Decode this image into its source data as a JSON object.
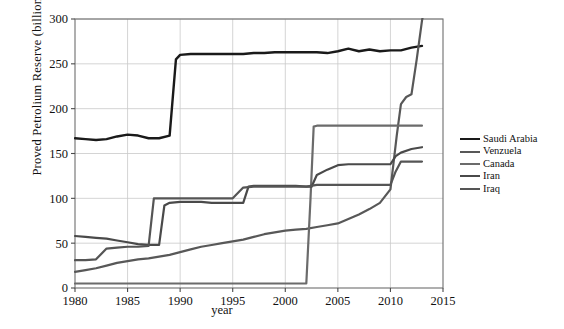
{
  "chart_data": {
    "type": "line",
    "title": "",
    "xlabel": "year",
    "ylabel": "Proved Petrolium Reserve (billions of Barrels)",
    "xlim": [
      1980,
      2015
    ],
    "ylim": [
      0,
      300
    ],
    "xticks": [
      1980,
      1985,
      1990,
      1995,
      2000,
      2005,
      2010,
      2015
    ],
    "yticks": [
      0,
      50,
      100,
      150,
      200,
      250,
      300
    ],
    "grid": true,
    "legend_position": "right",
    "series": [
      {
        "name": "Saudi Arabia",
        "color": "#1a1a1a",
        "width": 2.4,
        "points": [
          [
            1980,
            167
          ],
          [
            1981,
            166
          ],
          [
            1982,
            165
          ],
          [
            1983,
            166
          ],
          [
            1984,
            169
          ],
          [
            1985,
            171
          ],
          [
            1986,
            170
          ],
          [
            1987,
            167
          ],
          [
            1988,
            167
          ],
          [
            1989,
            170
          ],
          [
            1989.6,
            255
          ],
          [
            1990,
            260
          ],
          [
            1991,
            261
          ],
          [
            1992,
            261
          ],
          [
            1993,
            261
          ],
          [
            1994,
            261
          ],
          [
            1995,
            261
          ],
          [
            1996,
            261
          ],
          [
            1997,
            262
          ],
          [
            1998,
            262
          ],
          [
            1999,
            263
          ],
          [
            2000,
            263
          ],
          [
            2001,
            263
          ],
          [
            2002,
            263
          ],
          [
            2003,
            263
          ],
          [
            2004,
            262
          ],
          [
            2005,
            264
          ],
          [
            2006,
            267
          ],
          [
            2007,
            264
          ],
          [
            2008,
            266
          ],
          [
            2009,
            264
          ],
          [
            2010,
            265
          ],
          [
            2011,
            265
          ],
          [
            2012,
            268
          ],
          [
            2013,
            270
          ]
        ]
      },
      {
        "name": "Venzuela",
        "color": "#585858",
        "width": 2.2,
        "points": [
          [
            1980,
            18
          ],
          [
            1981,
            20
          ],
          [
            1982,
            22
          ],
          [
            1983,
            25
          ],
          [
            1984,
            28
          ],
          [
            1985,
            30
          ],
          [
            1986,
            32
          ],
          [
            1987,
            33
          ],
          [
            1988,
            35
          ],
          [
            1989,
            37
          ],
          [
            1990,
            40
          ],
          [
            1991,
            43
          ],
          [
            1992,
            46
          ],
          [
            1993,
            48
          ],
          [
            1994,
            50
          ],
          [
            1995,
            52
          ],
          [
            1996,
            54
          ],
          [
            1997,
            57
          ],
          [
            1998,
            60
          ],
          [
            1999,
            62
          ],
          [
            2000,
            64
          ],
          [
            2001,
            65
          ],
          [
            2002,
            66
          ],
          [
            2003,
            68
          ],
          [
            2004,
            70
          ],
          [
            2005,
            72
          ],
          [
            2006,
            77
          ],
          [
            2007,
            82
          ],
          [
            2008,
            88
          ],
          [
            2009,
            95
          ],
          [
            2010,
            110
          ],
          [
            2010.6,
            170
          ],
          [
            2011,
            205
          ],
          [
            2011.5,
            213
          ],
          [
            2012,
            216
          ],
          [
            2012.5,
            255
          ],
          [
            2013,
            298
          ],
          [
            2013.2,
            310
          ]
        ]
      },
      {
        "name": "Canada",
        "color": "#6b6b6b",
        "width": 2.2,
        "points": [
          [
            1980,
            5
          ],
          [
            1985,
            5
          ],
          [
            1990,
            5
          ],
          [
            1995,
            5
          ],
          [
            2000,
            5
          ],
          [
            2002,
            5
          ],
          [
            2002.4,
            100
          ],
          [
            2002.7,
            180
          ],
          [
            2003,
            181
          ],
          [
            2004,
            181
          ],
          [
            2005,
            181
          ],
          [
            2006,
            181
          ],
          [
            2007,
            181
          ],
          [
            2008,
            181
          ],
          [
            2009,
            181
          ],
          [
            2010,
            181
          ],
          [
            2011,
            181
          ],
          [
            2012,
            181
          ],
          [
            2013,
            181
          ]
        ]
      },
      {
        "name": "Iran",
        "color": "#4a4a4a",
        "width": 2.2,
        "points": [
          [
            1980,
            58
          ],
          [
            1981,
            57
          ],
          [
            1982,
            56
          ],
          [
            1983,
            55
          ],
          [
            1984,
            53
          ],
          [
            1985,
            51
          ],
          [
            1986,
            49
          ],
          [
            1987,
            48
          ],
          [
            1988,
            48
          ],
          [
            1988.5,
            92
          ],
          [
            1989,
            95
          ],
          [
            1990,
            96
          ],
          [
            1991,
            96
          ],
          [
            1992,
            96
          ],
          [
            1993,
            95
          ],
          [
            1994,
            95
          ],
          [
            1995,
            95
          ],
          [
            1996,
            95
          ],
          [
            1996.5,
            113
          ],
          [
            1997,
            114
          ],
          [
            1998,
            114
          ],
          [
            1999,
            114
          ],
          [
            2000,
            114
          ],
          [
            2001,
            114
          ],
          [
            2002,
            113
          ],
          [
            2002.5,
            113
          ],
          [
            2003,
            126
          ],
          [
            2004,
            132
          ],
          [
            2005,
            137
          ],
          [
            2006,
            138
          ],
          [
            2007,
            138
          ],
          [
            2008,
            138
          ],
          [
            2009,
            138
          ],
          [
            2010,
            138
          ],
          [
            2010.5,
            147
          ],
          [
            2011,
            151
          ],
          [
            2012,
            155
          ],
          [
            2013,
            157
          ]
        ]
      },
      {
        "name": "Iraq",
        "color": "#555555",
        "width": 2.2,
        "points": [
          [
            1980,
            31
          ],
          [
            1981,
            31
          ],
          [
            1982,
            32
          ],
          [
            1983,
            44
          ],
          [
            1984,
            45
          ],
          [
            1985,
            46
          ],
          [
            1986,
            46
          ],
          [
            1987,
            47
          ],
          [
            1987.5,
            100
          ],
          [
            1988,
            100
          ],
          [
            1989,
            100
          ],
          [
            1990,
            100
          ],
          [
            1991,
            100
          ],
          [
            1992,
            100
          ],
          [
            1993,
            100
          ],
          [
            1994,
            100
          ],
          [
            1995,
            100
          ],
          [
            1996,
            112
          ],
          [
            1997,
            113
          ],
          [
            1998,
            113
          ],
          [
            1999,
            113
          ],
          [
            2000,
            113
          ],
          [
            2001,
            113
          ],
          [
            2002,
            113
          ],
          [
            2003,
            115
          ],
          [
            2004,
            115
          ],
          [
            2005,
            115
          ],
          [
            2006,
            115
          ],
          [
            2007,
            115
          ],
          [
            2008,
            115
          ],
          [
            2009,
            115
          ],
          [
            2010,
            115
          ],
          [
            2010.5,
            130
          ],
          [
            2011,
            141
          ],
          [
            2012,
            141
          ],
          [
            2013,
            141
          ]
        ]
      }
    ]
  },
  "legend": {
    "items": [
      {
        "label": "Saudi Arabia"
      },
      {
        "label": "Venzuela"
      },
      {
        "label": "Canada"
      },
      {
        "label": "Iran"
      },
      {
        "label": "Iraq"
      }
    ]
  }
}
